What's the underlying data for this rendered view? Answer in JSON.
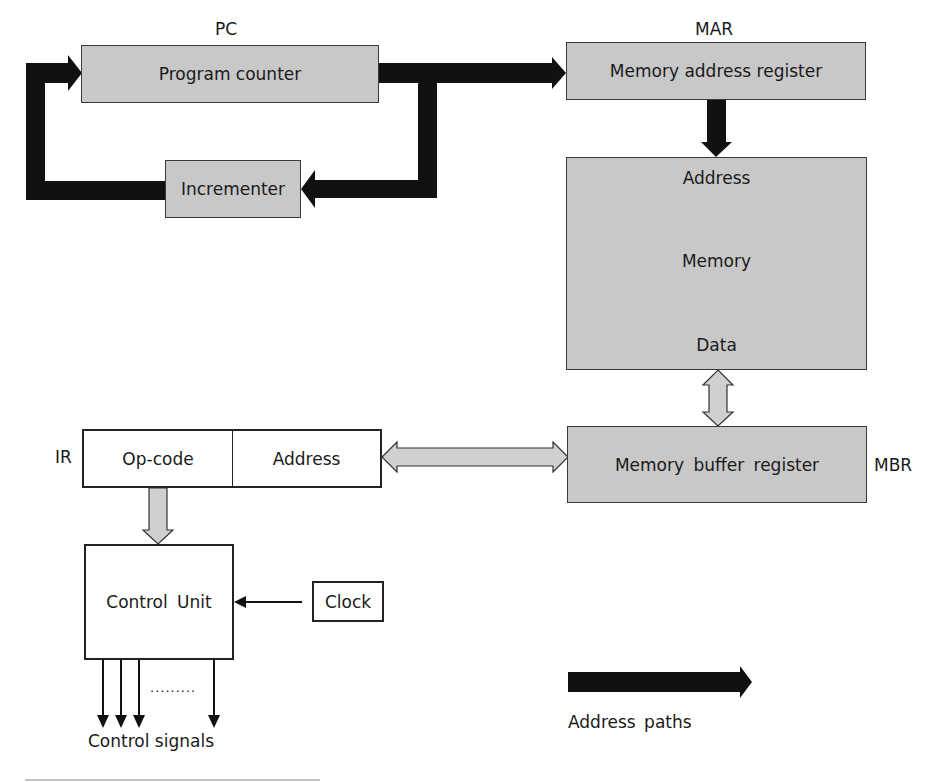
{
  "diagram": {
    "pc": {
      "tag": "PC",
      "name": "Program counter"
    },
    "incrementer": {
      "name": "Incrementer"
    },
    "mar": {
      "tag": "MAR",
      "name": "Memory address register"
    },
    "memory": {
      "address_label": "Address",
      "name": "Memory",
      "data_label": "Data"
    },
    "mbr": {
      "tag": "MBR",
      "name": "Memory buffer register"
    },
    "ir": {
      "tag": "IR",
      "opcode": "Op-code",
      "address": "Address"
    },
    "control_unit": {
      "name": "Control Unit"
    },
    "clock": {
      "name": "Clock"
    },
    "control_signals": {
      "label": "Control signals",
      "ellipsis": "........."
    },
    "legend": {
      "address_paths": "Address paths"
    }
  },
  "colors": {
    "register_fill": "#c8c8c8",
    "address_path": "#111111",
    "data_path_fill": "#d0d0d0",
    "outline": "#222222"
  }
}
